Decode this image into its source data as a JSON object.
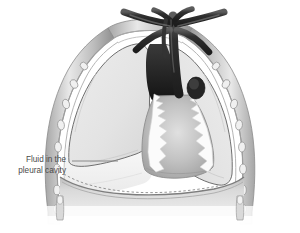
{
  "figure": {
    "background_color": "#ffffff"
  },
  "annotations": [
    {
      "id": "fluid-callout",
      "line1": "Fluid in the",
      "line2": "pleural cavity",
      "text_color": "#4a4a4a",
      "leader_color": "#8a8a8a"
    }
  ],
  "structures": {
    "chest_wall": {
      "name": "chest-wall",
      "outer_color": "#8e8e8e",
      "inner_color": "#d8d8d8",
      "rib_bead_color": "#efefef"
    },
    "pleura": {
      "name": "pleural-membrane",
      "color": "#b8b8b8"
    },
    "left_lung": {
      "name": "left-lung",
      "fill_color": "#e2e2e2",
      "outline_color": "#6f6f6f"
    },
    "right_lung": {
      "name": "right-lung",
      "fill_color": "#e2e2e2",
      "outline_color": "#6f6f6f"
    },
    "pleural_fluid": {
      "name": "pleural-fluid",
      "fill_color": "#f4f4f4"
    },
    "heart": {
      "name": "heart",
      "fill_color": "#b4b4b4",
      "highlight_color": "#dcdcdc"
    },
    "great_vessels": {
      "name": "great-vessels",
      "fill_color": "#2b2b2b",
      "highlight_color": "#6b6b6b"
    },
    "pericardium": {
      "name": "pericardial-tissue",
      "fill_color": "#fbfbfb"
    },
    "diaphragm": {
      "name": "diaphragm",
      "fill_color": "#cfcfcf",
      "outline_color": "#7d7d7d"
    }
  }
}
